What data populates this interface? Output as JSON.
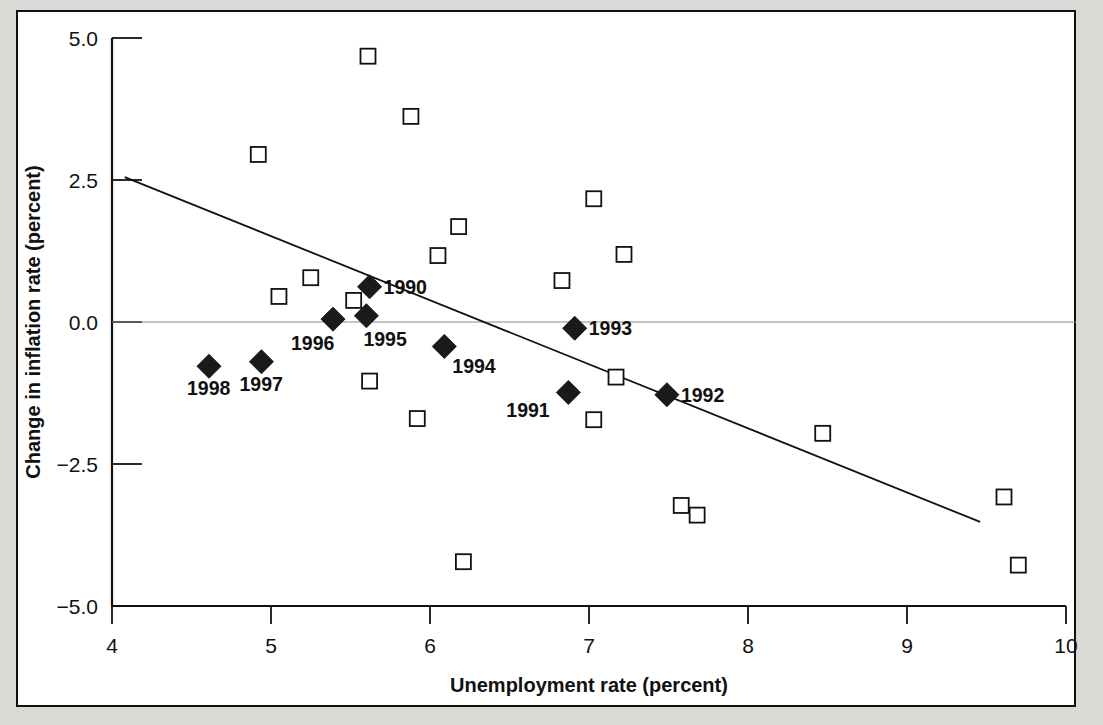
{
  "chart_data": {
    "type": "scatter",
    "title": "",
    "xlabel": "Unemployment rate (percent)",
    "ylabel": "Change in inflation rate (percent)",
    "xlim": [
      4,
      10
    ],
    "ylim": [
      -5.0,
      5.0
    ],
    "xticks": [
      4,
      5,
      6,
      7,
      8,
      9,
      10
    ],
    "xtick_labels": [
      "4",
      "5",
      "6",
      "7",
      "8",
      "9",
      "10"
    ],
    "yticks": [
      5.0,
      2.5,
      0.0,
      -2.5,
      -5.0
    ],
    "ytick_labels": [
      "5.0",
      "2.5",
      "0.0",
      "−2.5",
      "−5.0"
    ],
    "grid": false,
    "legend": "none",
    "zero_reference_line": 0.0,
    "series": [
      {
        "name": "Earlier years (open squares)",
        "marker": "open-square",
        "color": "#ffffff",
        "edge_color": "#111111",
        "points": [
          {
            "x": 5.61,
            "y": 4.68
          },
          {
            "x": 5.88,
            "y": 3.62
          },
          {
            "x": 4.92,
            "y": 2.95
          },
          {
            "x": 7.03,
            "y": 2.17
          },
          {
            "x": 6.18,
            "y": 1.68
          },
          {
            "x": 7.22,
            "y": 1.19
          },
          {
            "x": 6.05,
            "y": 1.17
          },
          {
            "x": 5.25,
            "y": 0.78
          },
          {
            "x": 6.83,
            "y": 0.73
          },
          {
            "x": 5.52,
            "y": 0.38
          },
          {
            "x": 5.05,
            "y": 0.45
          },
          {
            "x": 5.62,
            "y": -1.04
          },
          {
            "x": 7.17,
            "y": -0.97
          },
          {
            "x": 5.92,
            "y": -1.7
          },
          {
            "x": 7.03,
            "y": -1.72
          },
          {
            "x": 8.47,
            "y": -1.96
          },
          {
            "x": 7.58,
            "y": -3.23
          },
          {
            "x": 7.68,
            "y": -3.4
          },
          {
            "x": 9.61,
            "y": -3.08
          },
          {
            "x": 6.21,
            "y": -4.22
          },
          {
            "x": 9.7,
            "y": -4.28
          }
        ]
      },
      {
        "name": "1990-1998 (filled diamonds)",
        "marker": "filled-diamond",
        "color": "#1a1a1a",
        "points": [
          {
            "x": 5.62,
            "y": 0.62,
            "label": "1990",
            "label_dx": 14,
            "label_dy": 7
          },
          {
            "x": 6.87,
            "y": -1.24,
            "label": "1991",
            "label_dx": -62,
            "label_dy": 25
          },
          {
            "x": 7.49,
            "y": -1.28,
            "label": "1992",
            "label_dx": 14,
            "label_dy": 7
          },
          {
            "x": 6.91,
            "y": -0.11,
            "label": "1993",
            "label_dx": 14,
            "label_dy": 7
          },
          {
            "x": 6.09,
            "y": -0.43,
            "label": "1994",
            "label_dx": 8,
            "label_dy": 27
          },
          {
            "x": 5.6,
            "y": 0.11,
            "label": "1995",
            "label_dx": -3,
            "label_dy": 30
          },
          {
            "x": 5.39,
            "y": 0.05,
            "label": "1996",
            "label_dx": -42,
            "label_dy": 31
          },
          {
            "x": 4.94,
            "y": -0.7,
            "label": "1997",
            "label_dx": -22,
            "label_dy": 29
          },
          {
            "x": 4.61,
            "y": -0.78,
            "label": "1998",
            "label_dx": -22,
            "label_dy": 29
          }
        ]
      }
    ],
    "trend_line": {
      "name": "fitted regression line",
      "x_start": 4.08,
      "y_start": 2.55,
      "x_end": 9.46,
      "y_end": -3.52,
      "color": "#111111"
    }
  },
  "colors": {
    "page_background": "#d9d9d6",
    "panel_background": "#ffffff",
    "ink": "#111111",
    "zero_line": "#8a8a8a"
  }
}
